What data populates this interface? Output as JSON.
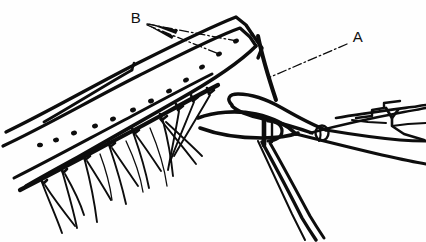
{
  "figure": {
    "kind": "surgical-line-drawing",
    "width": 426,
    "height": 242,
    "background_color": "#fefefe",
    "ink_color": "#0d0d0d",
    "style": "black-and-white pen-and-ink line art, no shading, white background"
  },
  "labels": [
    {
      "id": "label-a",
      "text": "A",
      "x": 358,
      "y": 38,
      "points_to": "suture thread descending from the folded apex of the band",
      "leader": {
        "style": "dash-dot",
        "x1": 347,
        "y1": 44,
        "x2": 268,
        "y2": 78
      }
    },
    {
      "id": "label-b",
      "text": "B",
      "x": 136,
      "y": 19,
      "points_to": "row of suture dots along the upper face of the band",
      "leaders": [
        {
          "style": "dash-dot",
          "x1": 147,
          "y1": 24,
          "x2": 237,
          "y2": 41
        },
        {
          "style": "dash-dot",
          "x1": 147,
          "y1": 25,
          "x2": 219,
          "y2": 54
        }
      ]
    }
  ],
  "elements": {
    "band": {
      "name": "curved-band",
      "description": "Wide curved band (buckle) arcing from lower left up to a folded apex at upper right",
      "line_width": 3.2,
      "dot_count": 12
    },
    "under_band": {
      "name": "under-band-strip",
      "description": "Narrower strip running beneath the main band, carrying the suture knots"
    },
    "sutures": {
      "name": "suture-threads",
      "count": 9,
      "description": "Knotted mattress sutures along the lower edge with free thread ends hanging down"
    },
    "forceps": {
      "name": "forceps-instrument",
      "description": "Long forceps entering from the right, jaws gripping the band; hinge pin circle and ratchet lock visible",
      "has_hinge_pin": true,
      "has_ratchet": true
    },
    "apex_thread": {
      "name": "apex-suture-thread",
      "description": "Single thick thread hanging from the folded apex of the band"
    }
  }
}
